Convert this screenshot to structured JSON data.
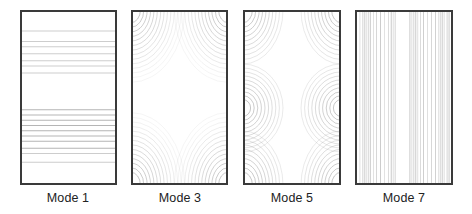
{
  "chart_data": [
    {
      "type": "heatmap",
      "subtype": "contour",
      "title": "Mode 1",
      "description": "Horizontal contour lines; uniform along x, varying along y",
      "orientation": "horizontal",
      "line_positions_fraction": [
        0.12,
        0.18,
        0.21,
        0.25,
        0.29,
        0.32,
        0.36,
        0.57,
        0.6,
        0.63,
        0.66,
        0.69,
        0.72,
        0.75,
        0.79,
        0.82,
        0.87
      ],
      "grid": false
    },
    {
      "type": "heatmap",
      "subtype": "contour",
      "title": "Mode 3",
      "description": "Concentric contour arcs centered at the four corners",
      "centers_fraction": [
        [
          0,
          0
        ],
        [
          1,
          0
        ],
        [
          0,
          1
        ],
        [
          1,
          1
        ]
      ],
      "ring_count": 14,
      "grid": false
    },
    {
      "type": "heatmap",
      "subtype": "contour",
      "title": "Mode 5",
      "description": "Concentric contour arcs centered at four corners and at mid-height of the left and right edges",
      "centers_fraction": [
        [
          0,
          0
        ],
        [
          1,
          0
        ],
        [
          0,
          0.56
        ],
        [
          1,
          0.56
        ],
        [
          0,
          1
        ],
        [
          1,
          1
        ]
      ],
      "ring_count": 10,
      "grid": false
    },
    {
      "type": "heatmap",
      "subtype": "contour",
      "title": "Mode 7",
      "description": "Dense vertical contour lines; uniform along y, varying along x with a blank band near the center",
      "orientation": "vertical",
      "line_positions_fraction": [
        0.05,
        0.08,
        0.1,
        0.12,
        0.14,
        0.16,
        0.19,
        0.22,
        0.26,
        0.3,
        0.34,
        0.37,
        0.39,
        0.41,
        0.56,
        0.58,
        0.6,
        0.62,
        0.64,
        0.67,
        0.7,
        0.74,
        0.78,
        0.82,
        0.85,
        0.87,
        0.89,
        0.91,
        0.94,
        0.96
      ],
      "grid": false
    }
  ],
  "labels": {
    "mode1": "Mode 1",
    "mode3": "Mode 3",
    "mode5": "Mode 5",
    "mode7": "Mode 7"
  },
  "colors": {
    "frame": "#3a3a3a",
    "contour": "#8a8a8a",
    "text": "#222222"
  }
}
